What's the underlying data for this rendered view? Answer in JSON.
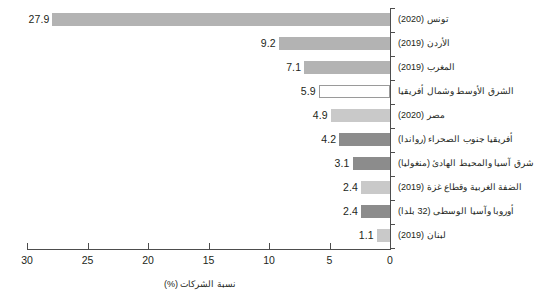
{
  "chart_data": {
    "type": "bar",
    "orientation": "horizontal-rtl",
    "title": "",
    "subtitle": "",
    "xlabel": "نسبة الشركات (%)",
    "ylabel": "",
    "xlim": [
      30,
      0
    ],
    "xticks": [
      30,
      25,
      20,
      15,
      10,
      5,
      0
    ],
    "xtick_labels": [
      "30",
      "25",
      "20",
      "15",
      "10",
      "5",
      "0"
    ],
    "grid": false,
    "legend": null,
    "axis_side": "right",
    "categories": [
      "تونس (2020)",
      "الأردن (2019)",
      "المغرب (2019)",
      "الشرق الأوسط وشمال أفريقيا",
      "مصر (2020)",
      "أفريقيا جنوب الصحراء (رواندا)",
      "شرق آسيا والمحيط الهادئ (منغوليا)",
      "الضفة الغربية وقطاع غزة (2019)",
      "أوروبا وآسيا الوسطى (32 بلدا)",
      "لبنان (2019)"
    ],
    "values": [
      27.9,
      9.2,
      7.1,
      5.9,
      4.9,
      4.2,
      3.1,
      2.4,
      2.4,
      1.1
    ],
    "value_labels": [
      "27.9",
      "9.2",
      "7.1",
      "5.9",
      "4.9",
      "4.2",
      "3.1",
      "2.4",
      "2.4",
      "1.1"
    ],
    "bar_styles": [
      "mid",
      "mid",
      "mid",
      "none",
      "light",
      "dark",
      "dark",
      "light",
      "dark",
      "light"
    ],
    "colors": {
      "mid": "#b3b3b3",
      "light": "#c9c9c9",
      "dark": "#8c8c8c",
      "none": "#ffffff",
      "axis": "#4d4d4d",
      "text": "#231f20"
    }
  },
  "bars": [
    {
      "category": "تونس (2020)",
      "value": 27.9,
      "label": "27.9",
      "style": "mid"
    },
    {
      "category": "الأردن (2019)",
      "value": 9.2,
      "label": "9.2",
      "style": "mid"
    },
    {
      "category": "المغرب (2019)",
      "value": 7.1,
      "label": "7.1",
      "style": "mid"
    },
    {
      "category": "الشرق الأوسط وشمال أفريقيا",
      "value": 5.9,
      "label": "5.9",
      "style": "none"
    },
    {
      "category": "مصر (2020)",
      "value": 4.9,
      "label": "4.9",
      "style": "light"
    },
    {
      "category": "أفريقيا جنوب الصحراء (رواندا)",
      "value": 4.2,
      "label": "4.2",
      "style": "dark"
    },
    {
      "category": "شرق آسيا والمحيط الهادئ (منغوليا)",
      "value": 3.1,
      "label": "3.1",
      "style": "dark"
    },
    {
      "category": "الضفة الغربية وقطاع غزة (2019)",
      "value": 2.4,
      "label": "2.4",
      "style": "light"
    },
    {
      "category": "أوروبا وآسيا الوسطى (32 بلدا)",
      "value": 2.4,
      "label": "2.4",
      "style": "dark"
    },
    {
      "category": "لبنان (2019)",
      "value": 1.1,
      "label": "1.1",
      "style": "light"
    }
  ],
  "axis": {
    "x_title": "نسبة الشركات (%)",
    "ticks": [
      "30",
      "25",
      "20",
      "15",
      "10",
      "5",
      "0"
    ]
  }
}
